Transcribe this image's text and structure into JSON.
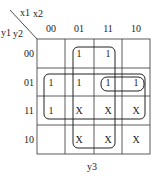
{
  "kmap": {
    "corner": {
      "col_vars": [
        "x1",
        "x2"
      ],
      "row_vars": [
        "y1",
        "y2"
      ]
    },
    "col_headers": [
      "00",
      "01",
      "11",
      "10"
    ],
    "row_headers": [
      "00",
      "01",
      "11",
      "10"
    ],
    "cells": [
      [
        "",
        "1",
        "1",
        ""
      ],
      [
        "1",
        "1",
        "1",
        "1"
      ],
      [
        "1",
        "X",
        "X",
        "X"
      ],
      [
        "",
        "X",
        "X",
        "X"
      ]
    ],
    "output_label": "y3",
    "groupings": [
      {
        "name": "vertical-group",
        "columns": [
          "01",
          "11"
        ],
        "rows": [
          "00",
          "01",
          "11",
          "10"
        ]
      },
      {
        "name": "horizontal-group",
        "columns": [
          "00",
          "01",
          "11",
          "10"
        ],
        "rows": [
          "01",
          "11"
        ]
      },
      {
        "name": "pair-group",
        "columns": [
          "11",
          "10"
        ],
        "rows": [
          "01"
        ]
      }
    ],
    "colors": {
      "line": "#222222",
      "background": "#ffffff"
    }
  }
}
